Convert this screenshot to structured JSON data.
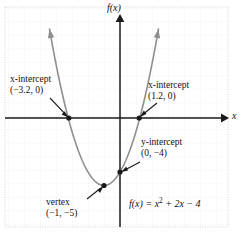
{
  "figure": {
    "kind": "coordinate-plane-graph",
    "background": "#ffffff",
    "grid_color": "#d9d9d9",
    "axis_color": "#1a1a1a",
    "curve_color": "#8a8a8a",
    "point_color": "#1a1a1a"
  },
  "axes": {
    "y_axis_label": "f(x)",
    "x_axis_label": "x",
    "origin_px": [
      120,
      118
    ],
    "unit_px_x": 16,
    "unit_px_y": 13.5,
    "xlim": [
      -7.2,
      6.7
    ],
    "ylim": [
      -8.2,
      7.9
    ],
    "grid": true,
    "tick_labels": []
  },
  "annotations": {
    "x_intercept_left": {
      "title": "x-intercept",
      "coords": "(−3.2, 0)",
      "point": [
        -3.2,
        0
      ]
    },
    "x_intercept_right": {
      "title": "x-intercept",
      "coords": "(1.2, 0)",
      "point": [
        1.2,
        0
      ]
    },
    "y_intercept": {
      "title": "y-intercept",
      "coords": "(0, −4)",
      "point": [
        0,
        -4
      ]
    },
    "vertex": {
      "title": "vertex",
      "coords": "(−1, −5)",
      "point": [
        -1,
        -5
      ]
    },
    "equation": {
      "lhs": "f(x) = ",
      "term1": "x",
      "exp1": "2",
      "rest": " + 2x − 4",
      "full": "f(x) = x² + 2x − 4"
    }
  },
  "chart_data": {
    "type": "line",
    "title": "",
    "xlabel": "x",
    "ylabel": "f(x)",
    "function": "f(x) = x^2 + 2x - 4",
    "xlim": [
      -7.2,
      6.7
    ],
    "ylim": [
      -8.2,
      7.9
    ],
    "grid": true,
    "series": [
      {
        "name": "f(x) = x^2 + 2x - 4",
        "x": [
          -4.4,
          -4.0,
          -3.5,
          -3.2,
          -3.0,
          -2.5,
          -2.0,
          -1.5,
          -1.0,
          -0.5,
          0.0,
          0.5,
          1.0,
          1.2,
          1.5,
          2.0,
          2.4
        ],
        "y": [
          6.56,
          4.0,
          1.25,
          0.0,
          -1.0,
          -2.75,
          -4.0,
          -4.75,
          -5.0,
          -4.75,
          -4.0,
          -2.75,
          -1.0,
          0.0,
          1.25,
          4.0,
          6.56
        ]
      }
    ],
    "key_points": [
      {
        "label": "x-intercept",
        "x": -3.2,
        "y": 0
      },
      {
        "label": "x-intercept",
        "x": 1.2,
        "y": 0
      },
      {
        "label": "y-intercept",
        "x": 0,
        "y": -4
      },
      {
        "label": "vertex",
        "x": -1,
        "y": -5
      }
    ]
  }
}
